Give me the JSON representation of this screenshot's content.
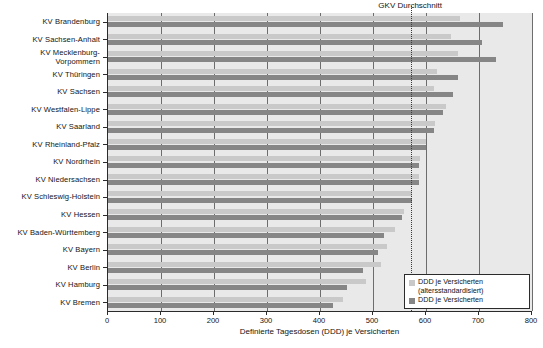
{
  "chart_data": {
    "type": "bar",
    "orientation": "horizontal",
    "title": "",
    "xlabel": "Definierte Tagesdosen (DDD) je Versicherten",
    "ylabel": "",
    "xlim": [
      0,
      800
    ],
    "xticks": [
      0,
      100,
      200,
      300,
      400,
      500,
      600,
      700,
      800
    ],
    "grid": true,
    "grid_axis": "x",
    "legend_position": "bottom-right",
    "categories": [
      "KV Brandenburg",
      "KV Sachsen-Anhalt",
      "KV Mecklenburg-\nVorpommern",
      "KV Thüringen",
      "KV Sachsen",
      "KV Westfalen-Lippe",
      "KV Saarland",
      "KV Rheinland-Pfalz",
      "KV Nordrhein",
      "KV Niedersachsen",
      "KV Schleswig-Holstein",
      "KV Hessen",
      "KV Baden-Württemberg",
      "KV Bayern",
      "KV Berlin",
      "KV Hamburg",
      "KV Bremen"
    ],
    "series": [
      {
        "name": "DDD je Versicherten (altersstandardisiert)",
        "color": "#c9c9c9",
        "values": [
          665,
          648,
          661,
          620,
          616,
          637,
          617,
          600,
          588,
          586,
          573,
          558,
          542,
          527,
          515,
          487,
          443
        ]
      },
      {
        "name": "DDD je Versicherten",
        "color": "#868686",
        "values": [
          745,
          705,
          733,
          661,
          650,
          633,
          616,
          600,
          586,
          586,
          573,
          555,
          521,
          509,
          481,
          450,
          425
        ]
      }
    ],
    "annotations": [
      {
        "label": "GKV Durchschnitt",
        "type": "vertical-line",
        "value": 572,
        "style": "dotted"
      }
    ]
  },
  "legend": {
    "items": [
      {
        "label": "DDD je Versicherten\n(altersstandardisiert)",
        "swatch": "light"
      },
      {
        "label": "DDD je Versicherten",
        "swatch": "dark"
      }
    ]
  },
  "colors": {
    "series_light": "#c9c9c9",
    "series_dark": "#868686",
    "plot_background": "#e9e9e9",
    "axis": "#2b2b2b",
    "gridline": "#6d6d6d",
    "text": "#141414"
  }
}
